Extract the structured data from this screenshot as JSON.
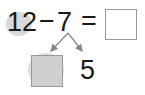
{
  "equation": {
    "minuend": "12",
    "operator": "−",
    "subtrahend": "7",
    "equals": "=",
    "answer": ""
  },
  "decomposition": {
    "left_part": "",
    "right_part": "5"
  },
  "colors": {
    "highlight": "#d9d9d9",
    "box_border": "#9a9a9a",
    "filled_box": "#cfcfcf",
    "arrow": "#888888",
    "text": "#1a1a1a"
  }
}
